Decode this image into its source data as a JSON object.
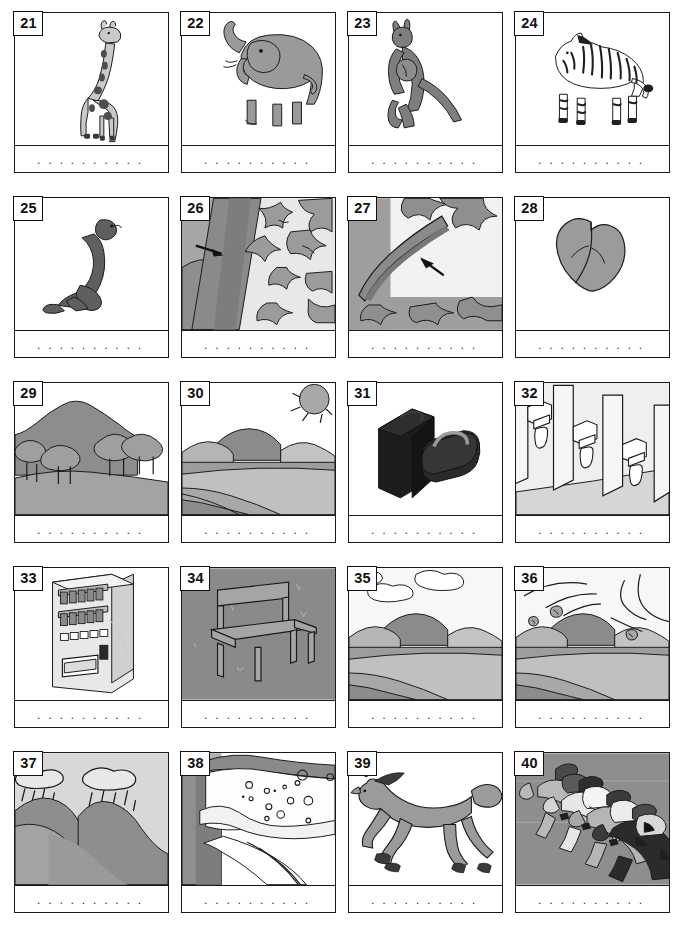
{
  "worksheet": {
    "title": "Picture vocabulary worksheet items 21-40",
    "answer_line_dots": ". . . . . . . . . . . . . . . . . . . . . . .",
    "columns": 4,
    "rows": 5,
    "number_range": "21-40",
    "colors": {
      "border": "#1a1a1a",
      "page_background": "#ffffff",
      "ink": "#111111",
      "tone_light": "#d9d9d9",
      "tone_mid": "#a8a8a8",
      "tone_dark": "#7a7a7a",
      "tone_darkest": "#3f3f3f"
    }
  },
  "cards": [
    {
      "number": "21",
      "subject": "giraffe",
      "icon": "giraffe-illustration",
      "answer": ""
    },
    {
      "number": "22",
      "subject": "elephant",
      "icon": "elephant-illustration",
      "answer": ""
    },
    {
      "number": "23",
      "subject": "kangaroo",
      "icon": "kangaroo-illustration",
      "answer": ""
    },
    {
      "number": "24",
      "subject": "zebra",
      "icon": "zebra-illustration",
      "answer": ""
    },
    {
      "number": "25",
      "subject": "seal",
      "icon": "seal-illustration",
      "answer": ""
    },
    {
      "number": "26",
      "subject": "tree trunk close-up with arrow",
      "icon": "trunk-closeup-illustration",
      "answer": ""
    },
    {
      "number": "27",
      "subject": "branch close-up with arrow",
      "icon": "branch-closeup-illustration",
      "answer": ""
    },
    {
      "number": "28",
      "subject": "leaf",
      "icon": "leaf-illustration",
      "answer": ""
    },
    {
      "number": "29",
      "subject": "hill with trees",
      "icon": "forest-hill-illustration",
      "answer": ""
    },
    {
      "number": "30",
      "subject": "sunny valley landscape",
      "icon": "sunny-valley-illustration",
      "answer": ""
    },
    {
      "number": "31",
      "subject": "suitcase and bag",
      "icon": "luggage-illustration",
      "answer": ""
    },
    {
      "number": "32",
      "subject": "row of urinals",
      "icon": "urinals-illustration",
      "answer": ""
    },
    {
      "number": "33",
      "subject": "vending machine",
      "icon": "vending-machine-illustration",
      "answer": ""
    },
    {
      "number": "34",
      "subject": "chair",
      "icon": "chair-illustration",
      "answer": ""
    },
    {
      "number": "35",
      "subject": "cloudy valley landscape",
      "icon": "cloudy-valley-illustration",
      "answer": ""
    },
    {
      "number": "36",
      "subject": "windy valley landscape",
      "icon": "windy-valley-illustration",
      "answer": ""
    },
    {
      "number": "37",
      "subject": "rain clouds over hills",
      "icon": "rainy-hills-illustration",
      "answer": ""
    },
    {
      "number": "38",
      "subject": "snowy mountain slope",
      "icon": "snowy-mountain-illustration",
      "answer": ""
    },
    {
      "number": "39",
      "subject": "galloping horse",
      "icon": "horse-illustration",
      "answer": ""
    },
    {
      "number": "40",
      "subject": "horse race",
      "icon": "horse-race-illustration",
      "answer": ""
    }
  ]
}
